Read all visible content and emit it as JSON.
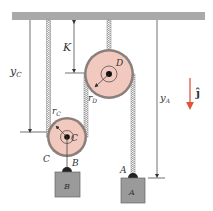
{
  "figure": {
    "type": "pulley-system",
    "labels": {
      "yC": "y",
      "yC_sub": "C",
      "K": "K",
      "rD": "r",
      "rD_sub": "D",
      "rC": "r",
      "rC_sub": "C",
      "pulleyD": "D",
      "pulleyC_center": "C",
      "pulleyC_outer": "C",
      "pointB": "B",
      "pointA": "A",
      "blockB": "B",
      "blockA": "A",
      "yA": "y",
      "yA_sub": "A",
      "unit_vector": "ĵ"
    },
    "colors": {
      "ceiling": "#a9a9a9",
      "pulley_fill": "#f2c9bf",
      "pulley_rim": "#8a7f7a",
      "block_fill": "#9a9a9a",
      "rope": "#8c8c8c",
      "arrow": "#e0533b",
      "line": "#333333"
    }
  }
}
